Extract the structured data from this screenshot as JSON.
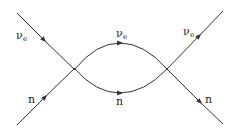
{
  "diagram": {
    "type": "feynman-diagram",
    "labels": {
      "in_top": {
        "main": "ν",
        "sub": "e"
      },
      "in_bottom": {
        "main": "n"
      },
      "loop_top": {
        "main": "ν",
        "sub": "e"
      },
      "loop_bottom": {
        "main": "n"
      },
      "out_top": {
        "main": "ν",
        "sub": "e"
      },
      "out_bottom": {
        "main": "n"
      }
    },
    "line_color": "#333333"
  }
}
